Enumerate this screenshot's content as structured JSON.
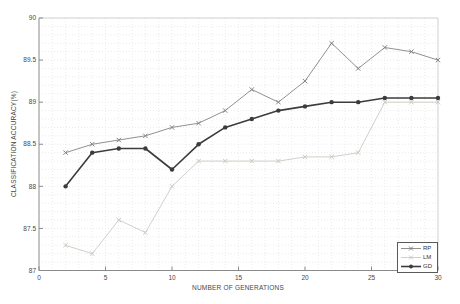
{
  "chart_data": {
    "type": "line",
    "title": "",
    "xlabel": "NUMBER OF GENERATIONS",
    "ylabel": "CLASSIFICATION ACCURACY(%)",
    "xlim": [
      0,
      30
    ],
    "ylim": [
      87,
      90
    ],
    "xticks": [
      0,
      5,
      10,
      15,
      20,
      25,
      30
    ],
    "yticks": [
      87,
      87.5,
      88,
      88.5,
      89,
      89.5,
      90
    ],
    "grid": "minor-dotted",
    "minor_x_step": 1,
    "minor_y_step": 0.1,
    "legend_position": "lower-right",
    "x": [
      2,
      4,
      6,
      8,
      10,
      12,
      14,
      16,
      18,
      20,
      22,
      24,
      26,
      28,
      30
    ],
    "series": [
      {
        "name": "RP",
        "color": "#848484",
        "marker": "x",
        "line_width": 0.9,
        "values": [
          88.4,
          88.5,
          88.55,
          88.6,
          88.7,
          88.75,
          88.9,
          89.15,
          89.0,
          89.25,
          89.7,
          89.4,
          89.65,
          89.6,
          89.5
        ]
      },
      {
        "name": "LM",
        "color": "#c8ccc2",
        "marker": "x",
        "line_width": 0.9,
        "values": [
          87.3,
          87.2,
          87.6,
          87.45,
          88.0,
          88.3,
          88.3,
          88.3,
          88.3,
          88.35,
          88.35,
          88.4,
          89.0,
          89.0,
          89.0
        ]
      },
      {
        "name": "GD",
        "color": "#3c3c3c",
        "marker": "circle",
        "line_width": 1.6,
        "values": [
          88.0,
          88.4,
          88.45,
          88.45,
          88.2,
          88.5,
          88.7,
          88.8,
          88.9,
          88.95,
          89.0,
          89.0,
          89.05,
          89.05,
          89.05
        ]
      }
    ]
  }
}
